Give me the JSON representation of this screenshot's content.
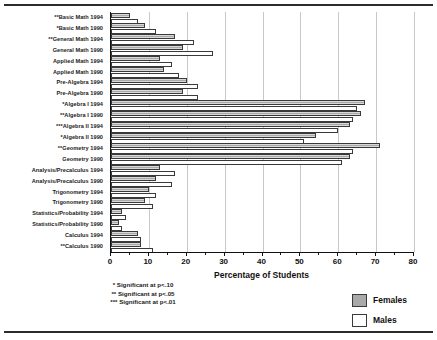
{
  "chart_data": {
    "type": "bar",
    "orientation": "horizontal",
    "title": "",
    "xlabel": "Percentage of Students",
    "ylabel": "",
    "xlim": [
      0,
      80
    ],
    "xticks": [
      0,
      10,
      20,
      30,
      40,
      50,
      60,
      70,
      80
    ],
    "grid": true,
    "legend_position": "bottom-right",
    "categories": [
      "**Basic Math 1994",
      "*Basic Math 1990",
      "**General Math 1994",
      "General Math 1990",
      "Applied Math 1994",
      "Applied Math 1990",
      "Pre-Algebra 1994",
      "Pre-Algebra 1990",
      "*Algebra I 1994",
      "**Algebra I 1990",
      "***Algebra II 1994",
      "*Algebra II 1990",
      "**Geometry 1994",
      "Geometry 1990",
      "Analysis/Precalculus 1994",
      "Analysis/Precalculus 1990",
      "Trigonometry 1994",
      "Trigonometry 1990",
      "Statistics/Probability 1994",
      "Statistics/Probability 1990",
      "Calculus 1994",
      "**Calculus 1990"
    ],
    "series": [
      {
        "name": "Females",
        "color": "#a9a9a9",
        "values": [
          5,
          9,
          17,
          19,
          13,
          14,
          20,
          19,
          67,
          66,
          63,
          54,
          71,
          63,
          13,
          12,
          10,
          9,
          3,
          2,
          7,
          8
        ]
      },
      {
        "name": "Males",
        "color": "#ffffff",
        "values": [
          7,
          12,
          22,
          27,
          16,
          18,
          23,
          23,
          65,
          64,
          60,
          51,
          64,
          61,
          17,
          16,
          12,
          11,
          4,
          3,
          8,
          11
        ]
      }
    ],
    "footnotes": [
      "* Significant at p<.10",
      "** Significant at p<.05",
      "*** Significant at p<.01"
    ]
  },
  "legend": {
    "entries": [
      {
        "label": "Females",
        "swatch": "females"
      },
      {
        "label": "Males",
        "swatch": "males"
      }
    ]
  }
}
